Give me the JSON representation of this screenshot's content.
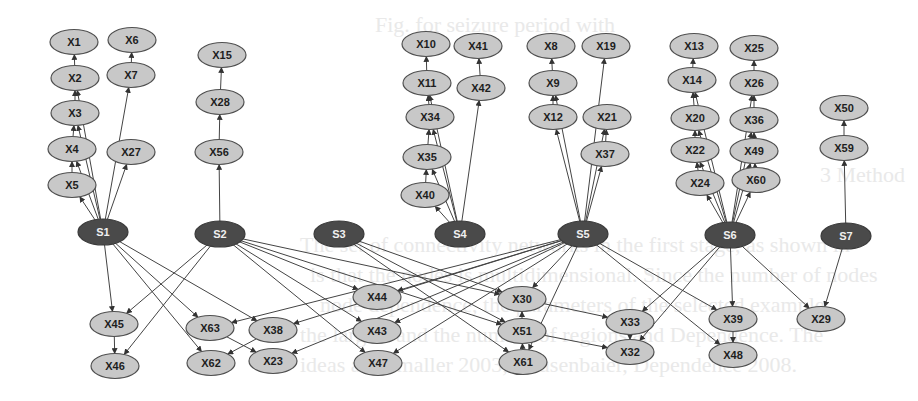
{
  "figure": {
    "title": "",
    "colors": {
      "background": "#ffffff",
      "source_fill": "#4a4a4a",
      "source_text": "#f0f0f0",
      "var_fill": "#c8c8c8",
      "var_stroke": "#505050",
      "var_text": "#1e1e1e",
      "edge": "#444444"
    }
  },
  "nodes": [
    {
      "id": "S1",
      "kind": "source",
      "x": 103,
      "y": 232
    },
    {
      "id": "S2",
      "kind": "source",
      "x": 220,
      "y": 234
    },
    {
      "id": "S3",
      "kind": "source",
      "x": 339,
      "y": 234
    },
    {
      "id": "S4",
      "kind": "source",
      "x": 460,
      "y": 234
    },
    {
      "id": "S5",
      "kind": "source",
      "x": 583,
      "y": 234
    },
    {
      "id": "S6",
      "kind": "source",
      "x": 730,
      "y": 235
    },
    {
      "id": "S7",
      "kind": "source",
      "x": 846,
      "y": 236
    },
    {
      "id": "X1",
      "kind": "var",
      "x": 74,
      "y": 42
    },
    {
      "id": "X6",
      "kind": "var",
      "x": 132,
      "y": 40
    },
    {
      "id": "X2",
      "kind": "var",
      "x": 75,
      "y": 78
    },
    {
      "id": "X7",
      "kind": "var",
      "x": 131,
      "y": 75
    },
    {
      "id": "X3",
      "kind": "var",
      "x": 75,
      "y": 113
    },
    {
      "id": "X4",
      "kind": "var",
      "x": 72,
      "y": 149
    },
    {
      "id": "X27",
      "kind": "var",
      "x": 131,
      "y": 152
    },
    {
      "id": "X5",
      "kind": "var",
      "x": 72,
      "y": 185
    },
    {
      "id": "X15",
      "kind": "var",
      "x": 222,
      "y": 55
    },
    {
      "id": "X28",
      "kind": "var",
      "x": 220,
      "y": 102
    },
    {
      "id": "X56",
      "kind": "var",
      "x": 219,
      "y": 152
    },
    {
      "id": "X10",
      "kind": "var",
      "x": 426,
      "y": 44
    },
    {
      "id": "X41",
      "kind": "var",
      "x": 478,
      "y": 46
    },
    {
      "id": "X11",
      "kind": "var",
      "x": 427,
      "y": 83
    },
    {
      "id": "X42",
      "kind": "var",
      "x": 481,
      "y": 88
    },
    {
      "id": "X34",
      "kind": "var",
      "x": 430,
      "y": 117
    },
    {
      "id": "X35",
      "kind": "var",
      "x": 427,
      "y": 157
    },
    {
      "id": "X40",
      "kind": "var",
      "x": 425,
      "y": 195
    },
    {
      "id": "X8",
      "kind": "var",
      "x": 551,
      "y": 46
    },
    {
      "id": "X19",
      "kind": "var",
      "x": 606,
      "y": 46
    },
    {
      "id": "X9",
      "kind": "var",
      "x": 553,
      "y": 83
    },
    {
      "id": "X12",
      "kind": "var",
      "x": 553,
      "y": 117
    },
    {
      "id": "X21",
      "kind": "var",
      "x": 607,
      "y": 117
    },
    {
      "id": "X37",
      "kind": "var",
      "x": 605,
      "y": 154
    },
    {
      "id": "X13",
      "kind": "var",
      "x": 694,
      "y": 46
    },
    {
      "id": "X25",
      "kind": "var",
      "x": 754,
      "y": 48
    },
    {
      "id": "X14",
      "kind": "var",
      "x": 692,
      "y": 80
    },
    {
      "id": "X26",
      "kind": "var",
      "x": 754,
      "y": 83
    },
    {
      "id": "X20",
      "kind": "var",
      "x": 695,
      "y": 118
    },
    {
      "id": "X36",
      "kind": "var",
      "x": 754,
      "y": 120
    },
    {
      "id": "X22",
      "kind": "var",
      "x": 695,
      "y": 150
    },
    {
      "id": "X49",
      "kind": "var",
      "x": 754,
      "y": 151
    },
    {
      "id": "X24",
      "kind": "var",
      "x": 700,
      "y": 183
    },
    {
      "id": "X60",
      "kind": "var",
      "x": 756,
      "y": 180
    },
    {
      "id": "X50",
      "kind": "var",
      "x": 844,
      "y": 108
    },
    {
      "id": "X59",
      "kind": "var",
      "x": 844,
      "y": 148
    },
    {
      "id": "X45",
      "kind": "var",
      "x": 114,
      "y": 324
    },
    {
      "id": "X46",
      "kind": "var",
      "x": 115,
      "y": 366
    },
    {
      "id": "X63",
      "kind": "var",
      "x": 210,
      "y": 328
    },
    {
      "id": "X38",
      "kind": "var",
      "x": 273,
      "y": 330
    },
    {
      "id": "X62",
      "kind": "var",
      "x": 211,
      "y": 363
    },
    {
      "id": "X23",
      "kind": "var",
      "x": 273,
      "y": 361
    },
    {
      "id": "X44",
      "kind": "var",
      "x": 377,
      "y": 297
    },
    {
      "id": "X43",
      "kind": "var",
      "x": 377,
      "y": 331
    },
    {
      "id": "X47",
      "kind": "var",
      "x": 378,
      "y": 363
    },
    {
      "id": "X30",
      "kind": "var",
      "x": 522,
      "y": 299
    },
    {
      "id": "X51",
      "kind": "var",
      "x": 522,
      "y": 331
    },
    {
      "id": "X61",
      "kind": "var",
      "x": 523,
      "y": 362
    },
    {
      "id": "X33",
      "kind": "var",
      "x": 630,
      "y": 322
    },
    {
      "id": "X32",
      "kind": "var",
      "x": 630,
      "y": 352
    },
    {
      "id": "X39",
      "kind": "var",
      "x": 733,
      "y": 319
    },
    {
      "id": "X48",
      "kind": "var",
      "x": 733,
      "y": 355
    },
    {
      "id": "X29",
      "kind": "var",
      "x": 821,
      "y": 319
    }
  ],
  "edges": [
    [
      "X2",
      "X1"
    ],
    [
      "X3",
      "X2"
    ],
    [
      "X4",
      "X3"
    ],
    [
      "X5",
      "X4"
    ],
    [
      "X7",
      "X6"
    ],
    [
      "S1",
      "X5"
    ],
    [
      "S1",
      "X4"
    ],
    [
      "S1",
      "X3"
    ],
    [
      "S1",
      "X2"
    ],
    [
      "S1",
      "X7"
    ],
    [
      "S1",
      "X27"
    ],
    [
      "X28",
      "X15"
    ],
    [
      "X56",
      "X28"
    ],
    [
      "S2",
      "X56"
    ],
    [
      "X11",
      "X10"
    ],
    [
      "X34",
      "X11"
    ],
    [
      "X35",
      "X34"
    ],
    [
      "X40",
      "X35"
    ],
    [
      "X42",
      "X41"
    ],
    [
      "S4",
      "X40"
    ],
    [
      "S4",
      "X35"
    ],
    [
      "S4",
      "X34"
    ],
    [
      "S4",
      "X11"
    ],
    [
      "S4",
      "X42"
    ],
    [
      "X9",
      "X8"
    ],
    [
      "X12",
      "X9"
    ],
    [
      "X37",
      "X21"
    ],
    [
      "S5",
      "X12"
    ],
    [
      "S5",
      "X9"
    ],
    [
      "S5",
      "X19"
    ],
    [
      "S5",
      "X37"
    ],
    [
      "S5",
      "X21"
    ],
    [
      "X14",
      "X13"
    ],
    [
      "X20",
      "X14"
    ],
    [
      "X22",
      "X20"
    ],
    [
      "X24",
      "X22"
    ],
    [
      "X26",
      "X25"
    ],
    [
      "X36",
      "X26"
    ],
    [
      "X49",
      "X36"
    ],
    [
      "X60",
      "X49"
    ],
    [
      "S6",
      "X24"
    ],
    [
      "S6",
      "X22"
    ],
    [
      "S6",
      "X20"
    ],
    [
      "S6",
      "X14"
    ],
    [
      "S6",
      "X60"
    ],
    [
      "S6",
      "X49"
    ],
    [
      "S6",
      "X36"
    ],
    [
      "S6",
      "X26"
    ],
    [
      "X59",
      "X50"
    ],
    [
      "S7",
      "X59"
    ],
    [
      "S1",
      "X45"
    ],
    [
      "S1",
      "X63"
    ],
    [
      "S1",
      "X62"
    ],
    [
      "S1",
      "X38"
    ],
    [
      "S2",
      "X45"
    ],
    [
      "S2",
      "X46"
    ],
    [
      "S2",
      "X44"
    ],
    [
      "S2",
      "X43"
    ],
    [
      "S2",
      "X47"
    ],
    [
      "S2",
      "X30"
    ],
    [
      "S2",
      "X51"
    ],
    [
      "X45",
      "X46"
    ],
    [
      "X63",
      "X23"
    ],
    [
      "X38",
      "X62"
    ],
    [
      "S3",
      "X30"
    ],
    [
      "S3",
      "X51"
    ],
    [
      "S3",
      "X61"
    ],
    [
      "S5",
      "X63"
    ],
    [
      "S5",
      "X38"
    ],
    [
      "S5",
      "X23"
    ],
    [
      "S5",
      "X44"
    ],
    [
      "S5",
      "X43"
    ],
    [
      "S5",
      "X47"
    ],
    [
      "S5",
      "X30"
    ],
    [
      "S5",
      "X61"
    ],
    [
      "S5",
      "X39"
    ],
    [
      "S5",
      "X48"
    ],
    [
      "X51",
      "X30"
    ],
    [
      "X61",
      "X51"
    ],
    [
      "X30",
      "X33"
    ],
    [
      "X51",
      "X32"
    ],
    [
      "X33",
      "X32"
    ],
    [
      "S6",
      "X33"
    ],
    [
      "S6",
      "X32"
    ],
    [
      "S6",
      "X39"
    ],
    [
      "S6",
      "X29"
    ],
    [
      "X39",
      "X48"
    ],
    [
      "S7",
      "X29"
    ]
  ],
  "bleed_through_text": [
    {
      "text": "Fig. for seizure period with",
      "x": 375,
      "y": 30
    },
    {
      "text": "3   Method",
      "x": 820,
      "y": 180
    },
    {
      "text": "The set of connectivity networks in the first stage, as shown in",
      "x": 300,
      "y": 250
    },
    {
      "text": "is that the nodes is multidimensional. Since the number of nodes",
      "x": 310,
      "y": 280
    },
    {
      "text": "node dependence, the parameters of the selected example",
      "x": 320,
      "y": 310
    },
    {
      "text": "the largest and the number of regions and Dependence. The",
      "x": 300,
      "y": 340
    },
    {
      "text": "ideas and smaller 2003, Hausenbaier, Dependence 2008.",
      "x": 300,
      "y": 370
    }
  ]
}
